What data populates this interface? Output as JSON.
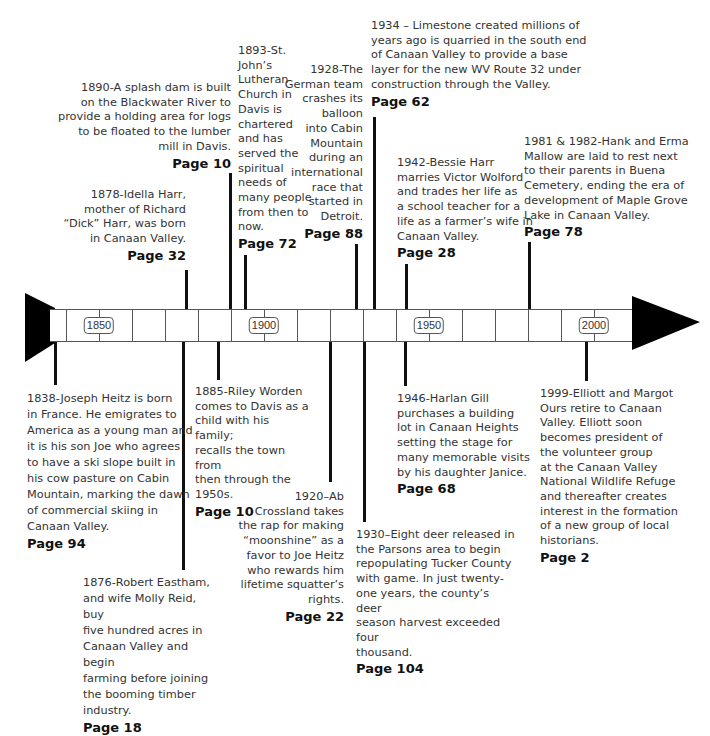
{
  "timeline": {
    "axis_labels": [
      "1850",
      "1900",
      "1950",
      "2000"
    ],
    "colors": {
      "line": "#111111",
      "text": "#333333",
      "bar_border": "#555555"
    }
  },
  "events_above": [
    {
      "year": "1878",
      "text": "1878-Idella Harr,\nmother of Richard\n“Dick” Harr, was born\nin Canaan Valley.",
      "page": "Page 32"
    },
    {
      "year": "1890",
      "text": "1890-A splash dam is built\non the Blackwater River to\nprovide a holding area for logs\nto be floated to the lumber\nmill in Davis.",
      "page": "Page 10"
    },
    {
      "year": "1893",
      "text": "1893-St.\nJohn’s\nLutheran\nChurch in\nDavis is\nchartered\nand has\nserved the\nspiritual\nneeds of\nmany people\nfrom then to\nnow.",
      "page": "Page 72"
    },
    {
      "year": "1928",
      "text": "1928-The\nGerman team\ncrashes its\nballoon\ninto Cabin\nMountain\nduring an\ninternational\nrace that\nstarted in\nDetroit.",
      "page": "Page 88"
    },
    {
      "year": "1934",
      "text": "1934 – Limestone created millions of\nyears ago is quarried in the south end\nof Canaan Valley to provide a base\nlayer for the new WV Route 32 under\nconstruction through the Valley.",
      "page": "Page 62"
    },
    {
      "year": "1942",
      "text": "1942-Bessie Harr\nmarries Victor Wolford\nand trades her life as\na school teacher for a\nlife as a farmer’s wife in\nCanaan Valley.",
      "page": "Page 28"
    },
    {
      "year": "1981 & 1982",
      "text": "1981 & 1982-Hank and Erma\nMallow are laid to rest next\nto their parents in Buena\nCemetery, ending the era of\ndevelopment of Maple Grove\nLake in Canaan Valley.",
      "page": "Page 78"
    }
  ],
  "events_below": [
    {
      "year": "1838",
      "text": "1838-Joseph Heitz is born\nin France. He emigrates to\nAmerica as a young man and\nit is his son Joe who agrees\nto have a ski slope built in\nhis cow pasture on Cabin\nMountain, marking the dawn\nof commercial skiing in\nCanaan Valley.",
      "page": "Page 94"
    },
    {
      "year": "1876",
      "text": "1876-Robert Eastham,\nand wife Molly Reid, buy\nfive hundred acres in\nCanaan Valley and begin\nfarming before joining\nthe booming timber\nindustry.",
      "page": "Page 18"
    },
    {
      "year": "1885",
      "text": "1885-Riley Worden\ncomes to Davis as a\nchild with his family;\nrecalls the town from\nthen through the\n1950s.",
      "page": "Page 10"
    },
    {
      "year": "1920",
      "text": "1920–Ab\nCrossland takes\nthe rap for making\n“moonshine” as a\nfavor to Joe Heitz\nwho rewards him\nlifetime squatter’s\nrights.",
      "page": "Page 22"
    },
    {
      "year": "1930",
      "text": "1930–Eight deer released in\nthe Parsons area to begin\nrepopulating Tucker County\nwith game.  In just twenty-\none years, the county’s deer\nseason harvest exceeded four\nthousand.",
      "page": "Page 104"
    },
    {
      "year": "1946",
      "text": "1946-Harlan Gill\npurchases a building\nlot in Canaan Heights\nsetting the stage for\nmany memorable visits\nby his daughter Janice.",
      "page": "Page 68"
    },
    {
      "year": "1999",
      "text": "1999-Elliott and Margot\nOurs retire to Canaan\nValley. Elliott soon\nbecomes president of\nthe volunteer group\nat the Canaan Valley\nNational Wildlife Refuge\nand thereafter creates\ninterest in the formation\nof a new group of local\nhistorians.",
      "page": "Page 2"
    }
  ]
}
